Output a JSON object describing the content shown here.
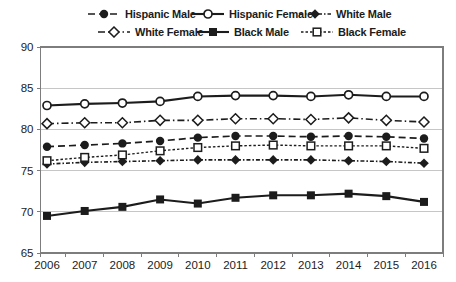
{
  "figure": {
    "ink_color": "#1c1c1c",
    "gridline_color": "#c6c6c6",
    "axis_box_color": "#7d7d7d",
    "background": "#ffffff"
  },
  "chart_data": {
    "type": "line",
    "title": "",
    "xlabel": "",
    "ylabel": "",
    "x": [
      2006,
      2007,
      2008,
      2009,
      2010,
      2011,
      2012,
      2013,
      2014,
      2015,
      2016
    ],
    "x_tick_labels": [
      "2006",
      "2007",
      "2008",
      "2009",
      "2010",
      "2011",
      "2012",
      "2013",
      "2014",
      "2015",
      "2016"
    ],
    "ylim": [
      65,
      90
    ],
    "yticks": [
      65,
      70,
      75,
      80,
      85,
      90
    ],
    "grid": "horizontal",
    "legend_position": "top",
    "series": [
      {
        "name": "Hispanic Male",
        "marker": "filled-circle",
        "line": "dashed",
        "values": [
          77.9,
          78.1,
          78.3,
          78.6,
          79.0,
          79.2,
          79.2,
          79.1,
          79.2,
          79.1,
          78.9
        ]
      },
      {
        "name": "Hispanic Female",
        "marker": "open-circle",
        "line": "solid",
        "values": [
          82.9,
          83.1,
          83.2,
          83.4,
          84.0,
          84.1,
          84.1,
          84.0,
          84.2,
          84.0,
          84.0
        ]
      },
      {
        "name": "White Male",
        "marker": "filled-diamond",
        "line": "dash-dot-fine",
        "values": [
          75.8,
          76.0,
          76.1,
          76.2,
          76.3,
          76.3,
          76.3,
          76.3,
          76.2,
          76.1,
          75.9
        ]
      },
      {
        "name": "White Female",
        "marker": "open-diamond",
        "line": "dash-dot",
        "values": [
          80.7,
          80.8,
          80.8,
          81.1,
          81.1,
          81.3,
          81.3,
          81.2,
          81.4,
          81.1,
          80.9
        ]
      },
      {
        "name": "Black Male",
        "marker": "filled-square",
        "line": "solid",
        "values": [
          69.5,
          70.1,
          70.6,
          71.5,
          71.0,
          71.7,
          72.0,
          72.0,
          72.2,
          71.9,
          71.2
        ]
      },
      {
        "name": "Black Female",
        "marker": "open-square",
        "line": "dotted",
        "values": [
          76.2,
          76.6,
          76.9,
          77.4,
          77.8,
          78.0,
          78.1,
          78.0,
          78.0,
          78.0,
          77.7
        ]
      }
    ]
  }
}
